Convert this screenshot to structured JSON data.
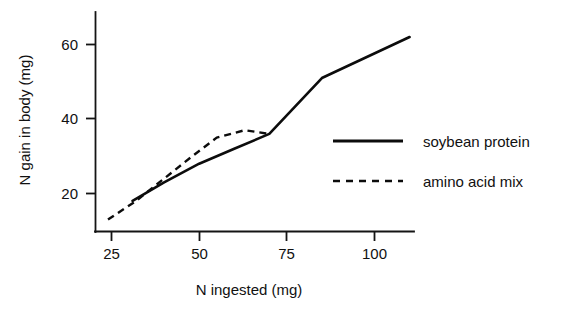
{
  "chart_data": {
    "type": "line",
    "title": "",
    "xlabel": "N ingested (mg)",
    "ylabel": "N gain in body (mg)",
    "xlim": [
      22,
      113
    ],
    "ylim": [
      11,
      66
    ],
    "xticks": [
      25,
      50,
      75,
      100
    ],
    "xtick_labels": [
      "25",
      "50",
      "75",
      "100"
    ],
    "yticks": [
      20,
      40,
      60
    ],
    "ytick_labels": [
      "20",
      "40",
      "60"
    ],
    "grid": false,
    "legend_position": "right-middle",
    "series": [
      {
        "name": "soybean protein",
        "style": "solid",
        "color": "#0c0c0c",
        "x": [
          31,
          40,
          50,
          60,
          70,
          85,
          110
        ],
        "y": [
          18,
          23,
          28,
          32,
          36,
          51,
          62
        ]
      },
      {
        "name": "amino acid mix",
        "style": "dashed",
        "color": "#0c0c0c",
        "x": [
          24,
          32,
          40,
          48,
          55,
          63,
          70
        ],
        "y": [
          13,
          18,
          24,
          30,
          35,
          37,
          36
        ]
      }
    ]
  },
  "legend": {
    "entries": [
      {
        "label": "soybean protein",
        "style": "solid"
      },
      {
        "label": "amino acid mix",
        "style": "dashed"
      }
    ]
  },
  "axes": {
    "x_title": "N ingested (mg)",
    "y_title": "N gain in body (mg)",
    "x_tick_labels": [
      "25",
      "50",
      "75",
      "100"
    ],
    "y_tick_labels": [
      "20",
      "40",
      "60"
    ]
  }
}
